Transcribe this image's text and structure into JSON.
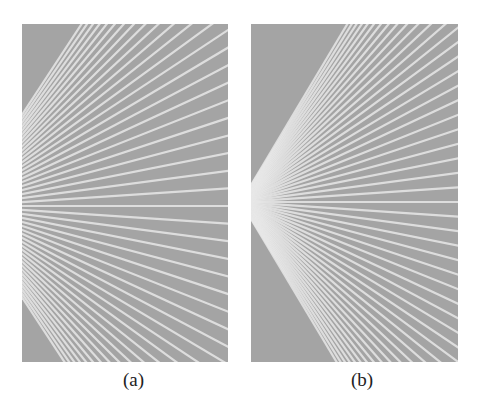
{
  "figure": {
    "panels": [
      {
        "id": "a",
        "caption": "(a)",
        "vanishing_point": {
          "x": -60,
          "y": 182
        },
        "line_count": 46,
        "spread": 420
      },
      {
        "id": "b",
        "caption": "(b)",
        "vanishing_point": {
          "x": -10,
          "y": 178
        },
        "line_count": 50,
        "spread": 380
      }
    ],
    "colors": {
      "background": "#a4a4a4",
      "line": "#e8e8e8",
      "page": "#ffffff",
      "caption": "#222222"
    }
  }
}
